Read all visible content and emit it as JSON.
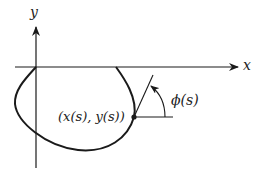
{
  "diagram": {
    "axes": {
      "x_label": "x",
      "y_label": "y"
    },
    "curve": {
      "description": "closed-ish curve below x-axis from origin to x-axis crossing on right"
    },
    "point_label": "(x(s), y(s))",
    "angle_label": "ϕ(s)",
    "colors": {
      "stroke": "#1a1a1a",
      "background": "#ffffff"
    }
  }
}
